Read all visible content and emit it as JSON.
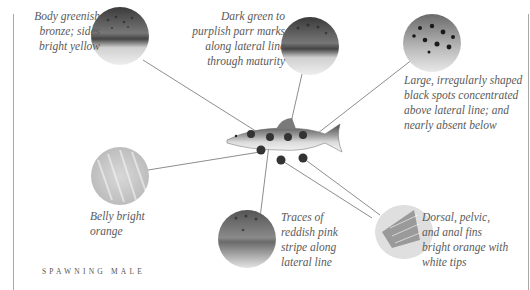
{
  "caption": "SPAWNING MALE",
  "callouts": [
    {
      "id": "body-color",
      "lines": [
        "Body greenish",
        "bronze; sides",
        "bright yellow"
      ]
    },
    {
      "id": "parr-marks",
      "lines": [
        "Dark green to",
        "purplish parr marks",
        "along lateral line",
        "through maturity"
      ]
    },
    {
      "id": "black-spots",
      "lines": [
        "Large, irregularly shaped",
        "black spots concentrated",
        "above lateral line; and",
        "nearly absent below"
      ]
    },
    {
      "id": "belly",
      "lines": [
        "Belly bright",
        "orange"
      ]
    },
    {
      "id": "pink-stripe",
      "lines": [
        "Traces of",
        "reddish pink",
        "stripe along",
        "lateral line"
      ]
    },
    {
      "id": "fins",
      "lines": [
        "Dorsal, pelvic,",
        "and anal fins",
        "bright orange with",
        "white tips"
      ]
    }
  ],
  "colors": {
    "line": "#707070",
    "text": "#5a5a5a",
    "frame": "#a8a8a8"
  }
}
